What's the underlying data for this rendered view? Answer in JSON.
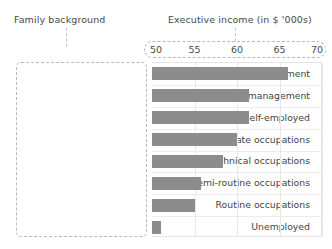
{
  "headings": {
    "left": "Family background",
    "right": "Executive income (in $ '000s)"
  },
  "chart_data": {
    "type": "bar",
    "orientation": "horizontal",
    "title": "Executive income (in $ '000s)",
    "xlabel": "Executive income (in $ '000s)",
    "ylabel": "Family background",
    "xlim": [
      50,
      70
    ],
    "xticks": [
      50,
      55,
      60,
      65,
      70
    ],
    "xtick_labels": [
      "50",
      "55",
      "60",
      "65",
      "70"
    ],
    "grid": true,
    "legend": "none",
    "bar_color": "#8c8c8c",
    "categories": [
      "Upper management",
      "Lower management",
      "Self-employed",
      "Intermediate occupations",
      "Technical occupations",
      "Semi-routine occupations",
      "Routine occupations",
      "Unemployed"
    ],
    "values": [
      66.0,
      61.4,
      61.4,
      60.0,
      58.4,
      55.8,
      55.0,
      51.0
    ]
  },
  "colors": {
    "bar": "#8c8c8c",
    "text": "#3f3f3f",
    "grid": "#e8e8e8",
    "dashed_border": "#b9b9b9"
  }
}
